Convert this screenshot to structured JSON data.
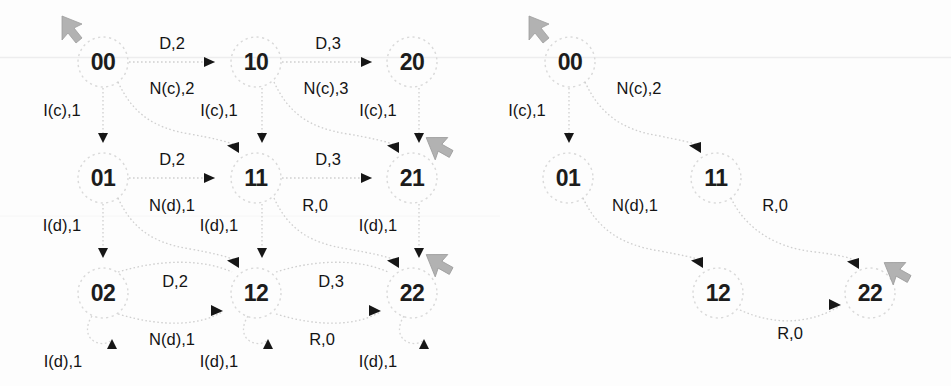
{
  "figure": {
    "background_color": "#fdfdfd",
    "node_outline_color": "#d8d8d8",
    "edge_color": "#cfcfcf",
    "arrow_color": "#161616",
    "marker_color": "#b0b0b0",
    "text_color": "#141414",
    "width": 951,
    "height": 386,
    "scanline_y": 57
  },
  "graphs": [
    {
      "id": "left-graph",
      "name": "full-state-graph",
      "nodes": [
        {
          "id": "L00",
          "label": "00",
          "x": 103,
          "y": 62
        },
        {
          "id": "L10",
          "label": "10",
          "x": 256,
          "y": 62
        },
        {
          "id": "L20",
          "label": "20",
          "x": 412,
          "y": 62
        },
        {
          "id": "L01",
          "label": "01",
          "x": 103,
          "y": 178
        },
        {
          "id": "L11",
          "label": "11",
          "x": 256,
          "y": 178
        },
        {
          "id": "L21",
          "label": "21",
          "x": 412,
          "y": 178
        },
        {
          "id": "L02",
          "label": "02",
          "x": 103,
          "y": 293
        },
        {
          "id": "L12",
          "label": "12",
          "x": 256,
          "y": 293
        },
        {
          "id": "L22",
          "label": "22",
          "x": 412,
          "y": 293
        }
      ],
      "edges": [
        {
          "from": "L00",
          "to": "L10",
          "label": "D,2",
          "label_x": 172,
          "label_y": 43
        },
        {
          "from": "L10",
          "to": "L20",
          "label": "D,3",
          "label_x": 328,
          "label_y": 43
        },
        {
          "from": "L01",
          "to": "L11",
          "label": "D,2",
          "label_x": 172,
          "label_y": 159
        },
        {
          "from": "L11",
          "to": "L21",
          "label": "D,3",
          "label_x": 328,
          "label_y": 159
        },
        {
          "from": "L02",
          "to": "L12",
          "label": "D,2",
          "label_x": 175,
          "label_y": 281
        },
        {
          "from": "L12",
          "to": "L22",
          "label": "D,3",
          "label_x": 331,
          "label_y": 281
        },
        {
          "from": "L00",
          "to": "L01",
          "label": "I(c),1",
          "label_x": 62,
          "label_y": 110
        },
        {
          "from": "L10",
          "to": "L11",
          "label": "I(c),1",
          "label_x": 219,
          "label_y": 110
        },
        {
          "from": "L20",
          "to": "L21",
          "label": "I(c),1",
          "label_x": 378,
          "label_y": 110
        },
        {
          "from": "L01",
          "to": "L02",
          "label": "I(d),1",
          "label_x": 62,
          "label_y": 225
        },
        {
          "from": "L11",
          "to": "L12",
          "label": "I(d),1",
          "label_x": 219,
          "label_y": 225
        },
        {
          "from": "L21",
          "to": "L22",
          "label": "I(d),1",
          "label_x": 378,
          "label_y": 225
        },
        {
          "from": "L00",
          "to": "L11",
          "label": "N(c),2",
          "label_x": 172,
          "label_y": 88
        },
        {
          "from": "L10",
          "to": "L21",
          "label": "N(c),3",
          "label_x": 326,
          "label_y": 88
        },
        {
          "from": "L01",
          "to": "L12",
          "label": "N(d),1",
          "label_x": 172,
          "label_y": 205
        },
        {
          "from": "L11",
          "to": "L22",
          "label": "R,0",
          "label_x": 315,
          "label_y": 205
        },
        {
          "from": "L02",
          "to": "L02",
          "label": "I(d),1",
          "label_x": 63,
          "label_y": 361
        },
        {
          "from": "L12",
          "to": "L12",
          "label": "I(d),1",
          "label_x": 219,
          "label_y": 361
        },
        {
          "from": "L22",
          "to": "L22",
          "label": "I(d),1",
          "label_x": 378,
          "label_y": 361
        },
        {
          "from": "L02",
          "to": "L12",
          "label": "N(d),1",
          "label_x": 172,
          "label_y": 339
        },
        {
          "from": "L12",
          "to": "L22",
          "label": "R,0",
          "label_x": 322,
          "label_y": 339
        }
      ],
      "markers": [
        {
          "name": "cursor-marker-start",
          "x": 70,
          "y": 28
        },
        {
          "name": "cursor-marker-21",
          "x": 437,
          "y": 143
        },
        {
          "name": "cursor-marker-22",
          "x": 437,
          "y": 258
        }
      ]
    },
    {
      "id": "right-graph",
      "name": "optimal-path-graph",
      "nodes": [
        {
          "id": "R00",
          "label": "00",
          "x": 570,
          "y": 62
        },
        {
          "id": "R01",
          "label": "01",
          "x": 568,
          "y": 178
        },
        {
          "id": "R11",
          "label": "11",
          "x": 716,
          "y": 178
        },
        {
          "id": "R12",
          "label": "12",
          "x": 718,
          "y": 293
        },
        {
          "id": "R22",
          "label": "22",
          "x": 870,
          "y": 293
        }
      ],
      "edges": [
        {
          "from": "R00",
          "to": "R01",
          "label": "I(c),1",
          "label_x": 527,
          "label_y": 110
        },
        {
          "from": "R00",
          "to": "R11",
          "label": "N(c),2",
          "label_x": 639,
          "label_y": 88
        },
        {
          "from": "R01",
          "to": "R12",
          "label": "N(d),1",
          "label_x": 635,
          "label_y": 205
        },
        {
          "from": "R11",
          "to": "R22",
          "label": "R,0",
          "label_x": 775,
          "label_y": 205
        },
        {
          "from": "R12",
          "to": "R22",
          "label": "R,0",
          "label_x": 790,
          "label_y": 333
        }
      ],
      "markers": [
        {
          "name": "cursor-marker-start",
          "x": 537,
          "y": 28
        },
        {
          "name": "cursor-marker-22",
          "x": 895,
          "y": 268
        }
      ]
    }
  ]
}
